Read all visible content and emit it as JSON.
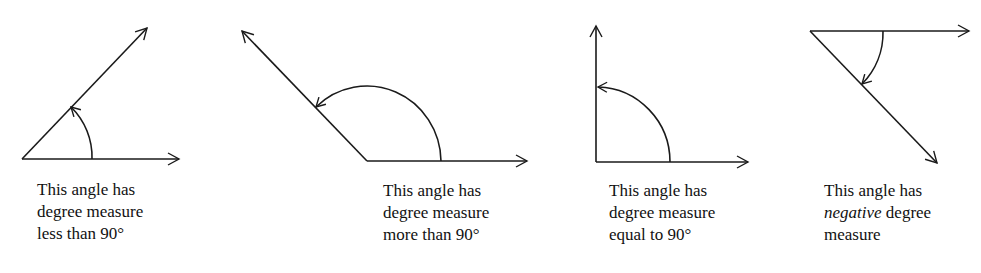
{
  "figure": {
    "panels": [
      {
        "id": "acute",
        "caption_lines": [
          "This angle has",
          "degree measure",
          "less than 90°"
        ],
        "vertex": [
          22,
          159
        ],
        "initial_ray_end": [
          180,
          159
        ],
        "terminal_ray_end": [
          148,
          27
        ],
        "arc": "counterclockwise"
      },
      {
        "id": "obtuse",
        "caption_lines": [
          "This angle has",
          "degree measure",
          "more than 90°"
        ],
        "vertex": [
          367,
          161
        ],
        "initial_ray_end": [
          528,
          161
        ],
        "terminal_ray_end": [
          241,
          30
        ],
        "arc": "counterclockwise"
      },
      {
        "id": "right",
        "caption_lines": [
          "This angle has",
          "degree measure",
          "equal to 90°"
        ],
        "vertex": [
          596,
          162
        ],
        "initial_ray_end": [
          749,
          162
        ],
        "terminal_ray_end": [
          596,
          25
        ],
        "arc": "counterclockwise"
      },
      {
        "id": "negative",
        "caption_lines": [
          "This angle has",
          "degree",
          "measure"
        ],
        "caption_emphasis": "negative",
        "vertex": [
          810,
          31
        ],
        "initial_ray_end": [
          970,
          31
        ],
        "terminal_ray_end": [
          938,
          164
        ],
        "arc": "clockwise"
      }
    ],
    "stroke_color": "#1a1a1a"
  }
}
